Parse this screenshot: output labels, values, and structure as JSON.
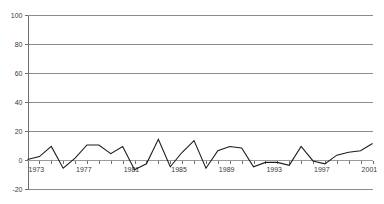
{
  "chart_data": {
    "type": "line",
    "title": "",
    "subtitle": "",
    "xlabel": "",
    "ylabel": "",
    "xlim": [
      1973,
      2002
    ],
    "ylim": [
      -20,
      100
    ],
    "grid": true,
    "legend": "none",
    "y_ticks": [
      100,
      80,
      60,
      40,
      20,
      0,
      -20
    ],
    "y_tick_labels": [
      "100",
      "80",
      "60",
      "40",
      "20",
      "0",
      "-20"
    ],
    "x_ticks": [
      1973,
      1977,
      1981,
      1985,
      1989,
      1993,
      1997,
      2001
    ],
    "x_tick_labels": [
      "1973",
      "1977",
      "1981",
      "1985",
      "1989",
      "1993",
      "1997",
      "2001"
    ],
    "x": [
      1973,
      1974,
      1975,
      1976,
      1977,
      1978,
      1979,
      1980,
      1981,
      1982,
      1983,
      1984,
      1985,
      1986,
      1987,
      1988,
      1989,
      1990,
      1991,
      1992,
      1993,
      1994,
      1995,
      1996,
      1997,
      1998,
      1999,
      2000,
      2001,
      2002
    ],
    "values": [
      0,
      2,
      9,
      -6,
      1,
      10,
      10,
      4,
      9,
      -7,
      -3,
      14,
      -5,
      5,
      13,
      -6,
      6,
      9,
      8,
      -5,
      -2,
      -2,
      -4,
      9,
      -1,
      -3,
      3,
      5,
      6,
      11
    ],
    "series": [
      {
        "name": "series-1",
        "color": "#1c1c1c",
        "values": [
          0,
          2,
          9,
          -6,
          1,
          10,
          10,
          4,
          9,
          -7,
          -3,
          14,
          -5,
          5,
          13,
          -6,
          6,
          9,
          8,
          -5,
          -2,
          -2,
          -4,
          9,
          -1,
          -3,
          3,
          5,
          6,
          11
        ]
      }
    ],
    "colors": {
      "line": "#1c1c1c",
      "grid": "#8c8c8c",
      "axis": "#6e6e6e",
      "text": "#3a3a3a",
      "background": "#ffffff"
    }
  }
}
